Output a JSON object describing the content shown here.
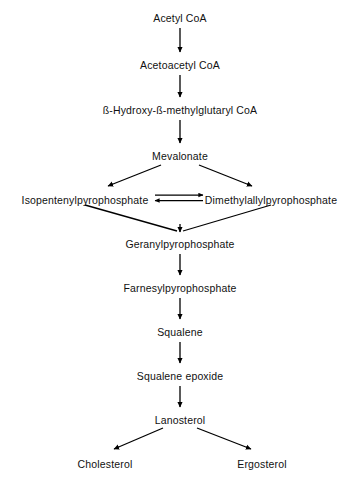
{
  "diagram": {
    "type": "flowchart",
    "background_color": "#ffffff",
    "line_color": "#000000",
    "text_color": "#111111",
    "nodes": [
      {
        "id": "acetyl_coa",
        "label": "Acetyl  CoA",
        "x": 180,
        "y": 12
      },
      {
        "id": "acetoacetyl_coa",
        "label": "Acetoacetyl  CoA",
        "x": 180,
        "y": 59
      },
      {
        "id": "hmg_coa",
        "label": "ß-Hydroxy-ß-methylglutaryl  CoA",
        "x": 180,
        "y": 104
      },
      {
        "id": "mevalonate",
        "label": "Mevalonate",
        "x": 180,
        "y": 150
      },
      {
        "id": "ipp",
        "label": "Isopentenylpyrophosphate",
        "x": 85,
        "y": 194
      },
      {
        "id": "dmapp",
        "label": "Dimethylallylpyrophosphate",
        "x": 271,
        "y": 194
      },
      {
        "id": "gpp",
        "label": "Geranylpyrophosphate",
        "x": 180,
        "y": 238
      },
      {
        "id": "fpp",
        "label": "Farnesylpyrophosphate",
        "x": 180,
        "y": 282
      },
      {
        "id": "squalene",
        "label": "Squalene",
        "x": 180,
        "y": 326
      },
      {
        "id": "squalene_epoxide",
        "label": "Squalene  epoxide",
        "x": 180,
        "y": 370
      },
      {
        "id": "lanosterol",
        "label": "Lanosterol",
        "x": 180,
        "y": 414
      },
      {
        "id": "cholesterol",
        "label": "Cholesterol",
        "x": 105,
        "y": 458
      },
      {
        "id": "ergosterol",
        "label": "Ergosterol",
        "x": 262,
        "y": 458
      }
    ],
    "edges": [
      {
        "id": "e1",
        "from": "acetyl_coa",
        "to": "acetoacetyl_coa",
        "kind": "vertical-arrow"
      },
      {
        "id": "e2",
        "from": "acetoacetyl_coa",
        "to": "hmg_coa",
        "kind": "vertical-arrow"
      },
      {
        "id": "e3",
        "from": "hmg_coa",
        "to": "mevalonate",
        "kind": "vertical-arrow"
      },
      {
        "id": "e4",
        "from": "mevalonate",
        "to": "ipp",
        "kind": "diagonal-arrow"
      },
      {
        "id": "e5",
        "from": "mevalonate",
        "to": "dmapp",
        "kind": "diagonal-arrow"
      },
      {
        "id": "e6",
        "from": "ipp",
        "to": "dmapp",
        "kind": "reversible-arrows"
      },
      {
        "id": "e7",
        "from": "ipp",
        "to": "gpp",
        "kind": "converging-line"
      },
      {
        "id": "e8",
        "from": "dmapp",
        "to": "gpp",
        "kind": "converging-line"
      },
      {
        "id": "e9",
        "from": "gpp",
        "to": "fpp",
        "kind": "vertical-arrow"
      },
      {
        "id": "e10",
        "from": "fpp",
        "to": "squalene",
        "kind": "vertical-arrow"
      },
      {
        "id": "e11",
        "from": "squalene",
        "to": "squalene_epoxide",
        "kind": "vertical-arrow"
      },
      {
        "id": "e12",
        "from": "squalene_epoxide",
        "to": "lanosterol",
        "kind": "vertical-arrow"
      },
      {
        "id": "e13",
        "from": "lanosterol",
        "to": "cholesterol",
        "kind": "diagonal-arrow"
      },
      {
        "id": "e14",
        "from": "lanosterol",
        "to": "ergosterol",
        "kind": "diagonal-arrow"
      }
    ]
  }
}
